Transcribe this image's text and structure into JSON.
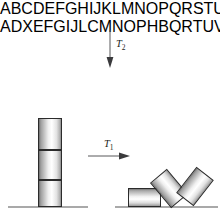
{
  "figure": {
    "background_color": "#ffffff",
    "ink_color": "#231f20",
    "ground_color": "#a9a9a9"
  },
  "sequences": {
    "input": "ABCDEFGHIJKLMNOPQRSTUVWXYZ",
    "output": "ADXEFGIJLCMNOPHBQRTUVKWSYKZ"
  },
  "transforms": {
    "t2": {
      "label": "T",
      "subscript": "2",
      "direction": "down",
      "arrow_icon": "arrow-down-icon"
    },
    "t1": {
      "label": "T",
      "subscript": "1",
      "direction": "right",
      "arrow_icon": "arrow-right-icon"
    }
  },
  "blocks": {
    "stack_label": "ordered-stack",
    "scattered_label": "toppled-blocks",
    "stack": [
      {
        "name": "upper-block",
        "rotation_deg": 0
      },
      {
        "name": "middle-block",
        "rotation_deg": 0
      },
      {
        "name": "lower-block",
        "rotation_deg": 0
      }
    ],
    "scattered": [
      {
        "name": "fallen-flat-block",
        "rotation_deg": 90
      },
      {
        "name": "leaning-left-block",
        "rotation_deg": -40
      },
      {
        "name": "leaning-right-block",
        "rotation_deg": 38
      }
    ]
  }
}
